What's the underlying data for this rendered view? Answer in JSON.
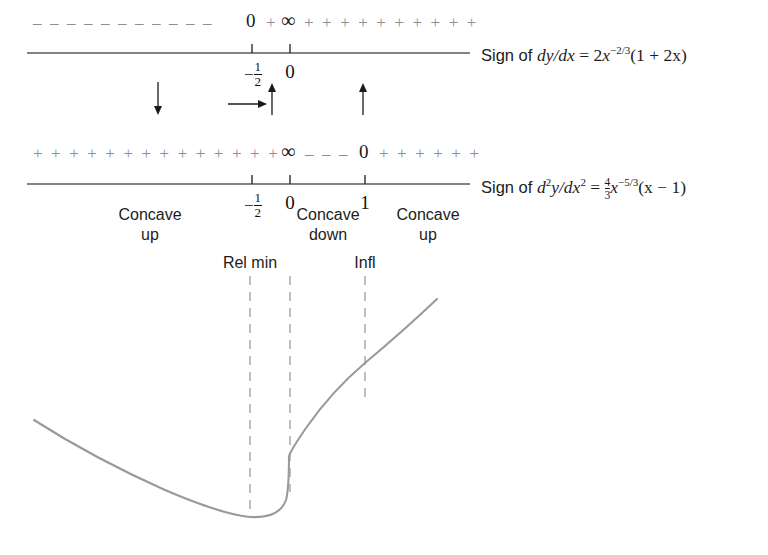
{
  "figure": {
    "curve_color": "#9a9a9a",
    "sign_color": "#8e8e92",
    "axis_color": "#5a5a5a"
  },
  "line1": {
    "signs_left": "–  –  –  –  –  –  –  –  –  –  –",
    "zero_label": "0",
    "plus_before_infty": "+",
    "infinity_label": "∞",
    "signs_right": "+  +  +  +  +  +  +  +  +  +",
    "ticks": [
      {
        "value": "-1/2",
        "num": "1",
        "den": "2",
        "sign": "−",
        "kind": "fraction"
      },
      {
        "value": "0",
        "kind": "integer"
      }
    ],
    "caption": {
      "prefix": "Sign of ",
      "derivative": "dy/dx",
      "equals": " = ",
      "rhs_coeff": "2",
      "rhs_var": "x",
      "rhs_exp": "−2/3",
      "rhs_factor": "(1 + 2x)"
    },
    "arrows": [
      {
        "name": "down-arrow-left",
        "direction": "down"
      },
      {
        "name": "right-arrow",
        "direction": "right"
      },
      {
        "name": "up-arrow-mid",
        "direction": "up"
      },
      {
        "name": "up-arrow-right",
        "direction": "up"
      }
    ]
  },
  "line2": {
    "signs_left": "+  +  +  +  +  +  +  +  +  +  +  +  +  +",
    "infinity_label": "∞",
    "signs_mid": "–  –  –",
    "zero_label": "0",
    "signs_right": "+  +  +  +  +  +",
    "ticks": [
      {
        "value": "-1/2",
        "num": "1",
        "den": "2",
        "sign": "−",
        "kind": "fraction"
      },
      {
        "value": "0",
        "kind": "integer"
      },
      {
        "value": "1",
        "kind": "integer"
      }
    ],
    "caption": {
      "prefix": "Sign of ",
      "derivative_d": "d",
      "derivative_sup": "2",
      "derivative_y": "y/dx",
      "derivative_sup2": "2",
      "equals": " = ",
      "frac_num": "4",
      "frac_den": "3",
      "rhs_var": "x",
      "rhs_exp": "−5/3",
      "rhs_factor": "(x − 1)"
    },
    "concavity": [
      {
        "label_line1": "Concave",
        "label_line2": "up"
      },
      {
        "label_line1": "Concave",
        "label_line2": "down"
      },
      {
        "label_line1": "Concave",
        "label_line2": "up"
      }
    ]
  },
  "graph": {
    "annotations": [
      {
        "name": "rel-min-label",
        "text": "Rel min"
      },
      {
        "name": "infl-label",
        "text": "Infl"
      }
    ],
    "guide_lines": [
      {
        "name": "guide-rel-min",
        "x": 250
      },
      {
        "name": "guide-cusp",
        "x": 290
      },
      {
        "name": "guide-infl",
        "x": 365
      }
    ],
    "curve_description": "Decreasing from upper-left to a relative minimum near x = -1/2, a cusp at x = 0, then increasing and concave up past the inflection at x = 1"
  }
}
